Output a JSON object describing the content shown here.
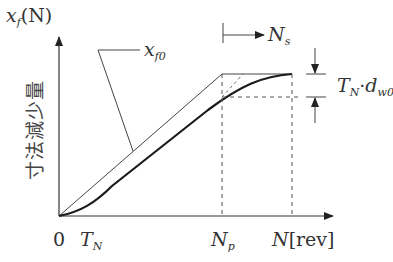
{
  "diagram": {
    "y_axis_title": {
      "main": "x",
      "sub": "f",
      "suffix": "(N)"
    },
    "y_axis_label_jp": "寸法減少量",
    "x_axis": {
      "origin": "0",
      "tick_TN": {
        "main": "T",
        "sub": "N"
      },
      "tick_Np": {
        "main": "N",
        "sub": "p"
      },
      "end_label": {
        "main": "N",
        "suffix": "[rev]"
      }
    },
    "curve_label": {
      "main": "x",
      "sub": "f0"
    },
    "ns_marker": {
      "main": "N",
      "sub": "s"
    },
    "offset_label": {
      "T": "T",
      "Tsub": "N",
      "dot": "·",
      "d": "d",
      "dsub": "w0"
    },
    "colors": {
      "line": "#333333",
      "thick": "#1a1a1a",
      "dashed": "#555555"
    }
  }
}
